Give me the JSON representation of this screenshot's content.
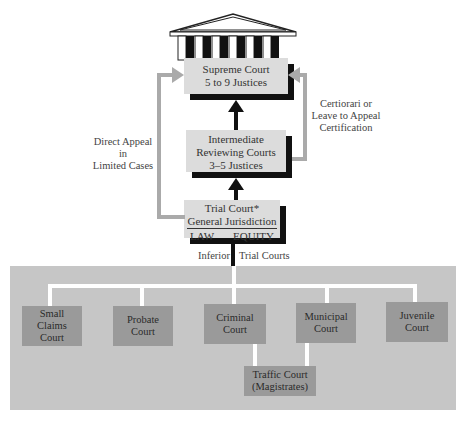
{
  "diagram": {
    "supreme": {
      "line1": "Supreme Court",
      "line2": "5 to 9 Justices"
    },
    "intermediate": {
      "line1": "Intermediate",
      "line2": "Reviewing Courts",
      "line3": "3–5 Justices"
    },
    "trial": {
      "line1": "Trial Court*",
      "line2": "General Jurisdiction",
      "law": "LAW",
      "equity": "EQUITY"
    },
    "left_label": {
      "line1": "Direct Appeal",
      "line2": "in",
      "line3": "Limited Cases"
    },
    "right_label": {
      "line1": "Certiorari or",
      "line2": "Leave to Appeal",
      "line3": "Certification"
    },
    "inferior_label": {
      "left": "Inferior",
      "right": "Trial Courts"
    },
    "inferior_courts": [
      {
        "line1": "Small",
        "line2": "Claims",
        "line3": "Court"
      },
      {
        "line1": "Probate",
        "line2": "Court"
      },
      {
        "line1": "Criminal",
        "line2": "Court"
      },
      {
        "line1": "Municipal",
        "line2": "Court"
      },
      {
        "line1": "Juvenile",
        "line2": "Court"
      }
    ],
    "traffic": {
      "line1": "Traffic Court",
      "line2": "(Magistrates)"
    }
  }
}
